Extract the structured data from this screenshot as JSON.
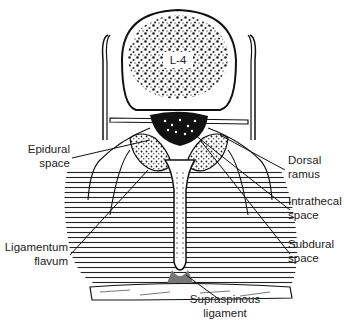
{
  "vertebra_label": "L-4",
  "labels": {
    "epidural": [
      "Epidural",
      "space"
    ],
    "ligamentum": [
      "Ligamentum",
      "flavum"
    ],
    "dorsal": [
      "Dorsal",
      "ramus"
    ],
    "intrathecal": [
      "Intrathecal",
      "space"
    ],
    "subdural": [
      "Subdural",
      "space"
    ],
    "supraspinous": [
      "Supraspinous",
      "ligament"
    ]
  },
  "colors": {
    "ink": "#1a1a1a",
    "background": "#ffffff"
  }
}
